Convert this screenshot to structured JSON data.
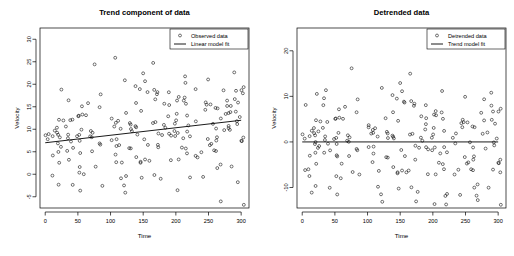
{
  "figure": {
    "width": 514,
    "height": 256,
    "background": "#ffffff",
    "foreground": "#000000",
    "panel_count": 2
  },
  "chart_data": [
    {
      "type": "scatter",
      "panel": "left",
      "title": "Trend component of data",
      "xlabel": "Time",
      "ylabel": "Velocity",
      "grid": false,
      "xlim": [
        -8,
        312
      ],
      "ylim": [
        -7.5,
        32.5
      ],
      "xticks": [
        0,
        50,
        100,
        150,
        200,
        250,
        300
      ],
      "xticklabels": [
        "0",
        "50",
        "100",
        "150",
        "200",
        "250",
        "300"
      ],
      "yticks": [
        -5,
        0,
        5,
        10,
        15,
        20,
        25,
        30
      ],
      "yticklabels": [
        "-5",
        "0",
        "5",
        "10",
        "15",
        "20",
        "25",
        "30"
      ],
      "legend": {
        "position": "top-right",
        "entries": [
          {
            "label": "Observed data",
            "marker": "circle-open",
            "color": "#000000"
          },
          {
            "label": "Linear model fit",
            "marker": "line",
            "color": "#000000"
          }
        ]
      },
      "series": [
        {
          "name": "Observed data",
          "marker": "circle-open",
          "n": 200,
          "noise_sd": 6.2,
          "seed": 20394,
          "trend_intercept": 7.0,
          "trend_slope": 0.0167
        },
        {
          "name": "Linear model fit",
          "type": "line",
          "x": [
            0,
            300
          ],
          "y": [
            7.0,
            12.0
          ]
        }
      ]
    },
    {
      "type": "scatter",
      "panel": "right",
      "title": "Detrended data",
      "xlabel": "Time",
      "ylabel": "Velocity",
      "grid": false,
      "xlim": [
        -8,
        312
      ],
      "ylim": [
        -14.5,
        25.0
      ],
      "xticks": [
        0,
        50,
        100,
        150,
        200,
        250,
        300
      ],
      "xticklabels": [
        "0",
        "50",
        "100",
        "150",
        "200",
        "250",
        "300"
      ],
      "yticks": [
        -10,
        0,
        10,
        20
      ],
      "yticklabels": [
        "-10",
        "0",
        "10",
        "20"
      ],
      "legend": {
        "position": "top-right",
        "entries": [
          {
            "label": "Detrended data",
            "marker": "circle-open",
            "color": "#000000"
          },
          {
            "label": "Trend model fit",
            "marker": "line",
            "color": "#000000"
          }
        ]
      },
      "series": [
        {
          "name": "Detrended data",
          "marker": "circle-open",
          "n": 200,
          "noise_sd": 6.2,
          "seed": 20394,
          "trend_intercept": 0.0,
          "trend_slope": 0.0
        },
        {
          "name": "Trend model fit",
          "type": "line",
          "x": [
            0,
            300
          ],
          "y": [
            0,
            0
          ]
        }
      ]
    }
  ]
}
